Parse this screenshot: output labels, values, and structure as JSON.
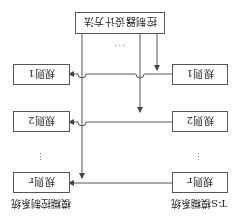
{
  "figure": {
    "orientation": "rotated-180",
    "controller_box": {
      "label": "控制器设计方法",
      "ellipsis": "···"
    },
    "ts_system": {
      "title": "T-S模糊系统",
      "rules": [
        {
          "label": "规则1"
        },
        {
          "label": "规则2"
        },
        {
          "label": "规则r"
        }
      ],
      "ellipsis": "⋮"
    },
    "fuzzy_control_system": {
      "title": "模糊控制系统",
      "rules": [
        {
          "label": "规则1"
        },
        {
          "label": "规则2"
        },
        {
          "label": "规则r"
        }
      ],
      "ellipsis": "⋮"
    },
    "colors": {
      "line": "#555555",
      "text": "#222222",
      "background": "#ffffff"
    }
  }
}
